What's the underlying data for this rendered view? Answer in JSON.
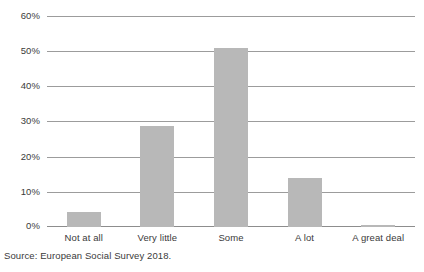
{
  "chart_data": {
    "type": "bar",
    "title": "",
    "subtitle": "",
    "xlabel": "",
    "ylabel": "",
    "categories": [
      "Not at all",
      "Very little",
      "Some",
      "A lot",
      "A great deal"
    ],
    "values": [
      4.3,
      28.8,
      50.8,
      14.0,
      0.5
    ],
    "series": [
      {
        "name": "",
        "values": [
          4.3,
          28.8,
          50.8,
          14.0,
          0.5
        ]
      }
    ],
    "ylim": [
      0,
      60
    ],
    "yticks": [
      0,
      10,
      20,
      30,
      40,
      50,
      60
    ],
    "ytick_labels": [
      "0%",
      "10%",
      "20%",
      "30%",
      "40%",
      "50%",
      "60%"
    ],
    "grid": true,
    "grid_axis": "y",
    "legend": false,
    "legend_position": "none",
    "annotations": [],
    "colors": {
      "bar_fill": "#b8b8b8",
      "gridline": "#9c9c9c",
      "baseline": "#8d8d8d",
      "text": "#3a3a3a",
      "background": "#ffffff"
    }
  },
  "source": {
    "text": "Source: European Social Survey 2018."
  }
}
